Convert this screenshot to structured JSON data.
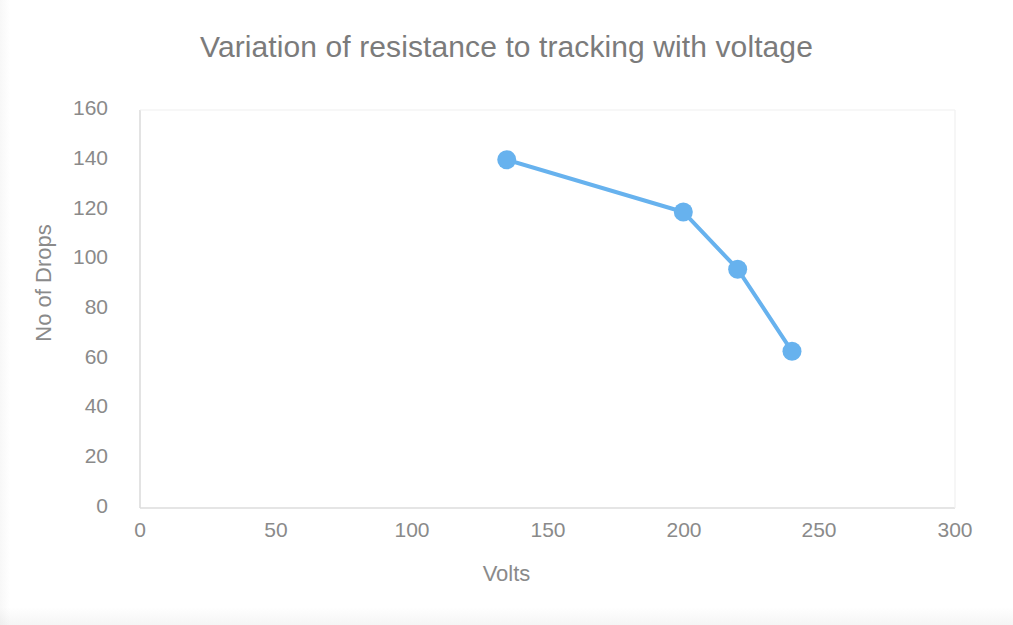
{
  "chart_data": {
    "type": "line",
    "title": "Variation of resistance to tracking with voltage",
    "xlabel": "Volts",
    "ylabel": "No of Drops",
    "x": [
      135,
      200,
      220,
      240
    ],
    "values": [
      140,
      119,
      96,
      63
    ],
    "series": [
      {
        "name": "No of Drops",
        "x": [
          135,
          200,
          220,
          240
        ],
        "values": [
          140,
          119,
          96,
          63
        ],
        "color": "#67B2EE",
        "marker": "circle",
        "line_width": 4
      }
    ],
    "xlim": [
      0,
      300
    ],
    "ylim": [
      0,
      160
    ],
    "xticks": [
      0,
      50,
      100,
      150,
      200,
      250,
      300
    ],
    "yticks": [
      0,
      20,
      40,
      60,
      80,
      100,
      120,
      140,
      160
    ],
    "xtick_labels": [
      "0",
      "50",
      "100",
      "150",
      "200",
      "250",
      "300"
    ],
    "ytick_labels": [
      "0",
      "20",
      "40",
      "60",
      "80",
      "100",
      "120",
      "140",
      "160"
    ],
    "grid": false,
    "legend": false,
    "legend_position": "none",
    "annotations": [],
    "colors": {
      "series": "#67B2EE",
      "text": "#8a8a8a",
      "title_text": "#7b7b7b",
      "axis_line": "#d9d9d9",
      "background": "#ffffff"
    }
  }
}
